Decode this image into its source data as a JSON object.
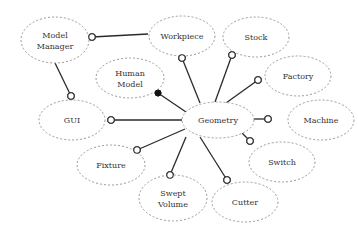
{
  "diagram": {
    "title": "",
    "center_node": "Geometry",
    "nodes": [
      {
        "id": "model_manager",
        "label_lines": [
          "Model",
          "Manager"
        ],
        "cx": 55,
        "cy": 40,
        "rx": 34,
        "ry": 23
      },
      {
        "id": "workpiece",
        "label_lines": [
          "Workpiece"
        ],
        "cx": 182,
        "cy": 36,
        "rx": 33,
        "ry": 20
      },
      {
        "id": "stock",
        "label_lines": [
          "Stock"
        ],
        "cx": 256,
        "cy": 37,
        "rx": 33,
        "ry": 20
      },
      {
        "id": "human_model",
        "label_lines": [
          "Human",
          "Model"
        ],
        "cx": 130,
        "cy": 78,
        "rx": 34,
        "ry": 20
      },
      {
        "id": "factory",
        "label_lines": [
          "Factory"
        ],
        "cx": 298,
        "cy": 76,
        "rx": 33,
        "ry": 20
      },
      {
        "id": "gui",
        "label_lines": [
          "GUI"
        ],
        "cx": 72,
        "cy": 120,
        "rx": 33,
        "ry": 20
      },
      {
        "id": "geometry",
        "label_lines": [
          "Geometry"
        ],
        "cx": 218,
        "cy": 120,
        "rx": 36,
        "ry": 18
      },
      {
        "id": "machine",
        "label_lines": [
          "Machine"
        ],
        "cx": 321,
        "cy": 120,
        "rx": 33,
        "ry": 20
      },
      {
        "id": "fixture",
        "label_lines": [
          "Fixture"
        ],
        "cx": 111,
        "cy": 165,
        "rx": 34,
        "ry": 20
      },
      {
        "id": "switch",
        "label_lines": [
          "Switch"
        ],
        "cx": 282,
        "cy": 162,
        "rx": 33,
        "ry": 20
      },
      {
        "id": "swept_volume",
        "label_lines": [
          "Swept",
          "Volume"
        ],
        "cx": 173,
        "cy": 198,
        "rx": 34,
        "ry": 23
      },
      {
        "id": "cutter",
        "label_lines": [
          "Cutter"
        ],
        "cx": 245,
        "cy": 202,
        "rx": 33,
        "ry": 20
      }
    ],
    "edges": [
      {
        "from": "model_manager",
        "to": "workpiece",
        "x1": 92,
        "y1": 37,
        "x2": 148,
        "y2": 34,
        "end": "open",
        "end_at": "x1"
      },
      {
        "from": "model_manager",
        "to": "gui",
        "x1": 55,
        "y1": 63,
        "x2": 71,
        "y2": 96,
        "end": "open",
        "end_at": "x2"
      },
      {
        "from": "gui",
        "to": "geometry",
        "x1": 111,
        "y1": 120,
        "x2": 182,
        "y2": 120,
        "end": "open",
        "end_at": "x1"
      },
      {
        "from": "geometry",
        "to": "workpiece",
        "x1": 200,
        "y1": 103,
        "x2": 182,
        "y2": 58,
        "end": "open",
        "end_at": "x2"
      },
      {
        "from": "geometry",
        "to": "stock",
        "x1": 215,
        "y1": 102,
        "x2": 232,
        "y2": 55,
        "end": "open",
        "end_at": "x2"
      },
      {
        "from": "geometry",
        "to": "factory",
        "x1": 226,
        "y1": 103,
        "x2": 258,
        "y2": 80,
        "end": "open",
        "end_at": "x2"
      },
      {
        "from": "geometry",
        "to": "machine",
        "x1": 254,
        "y1": 119,
        "x2": 268,
        "y2": 119,
        "end": "open",
        "end_at": "x2"
      },
      {
        "from": "geometry",
        "to": "switch",
        "x1": 242,
        "y1": 133,
        "x2": 250,
        "y2": 141,
        "end": "open",
        "end_at": "x2"
      },
      {
        "from": "geometry",
        "to": "cutter",
        "x1": 200,
        "y1": 137,
        "x2": 227,
        "y2": 180,
        "end": "open",
        "end_at": "x2"
      },
      {
        "from": "geometry",
        "to": "swept_volume",
        "x1": 186,
        "y1": 137,
        "x2": 170,
        "y2": 175,
        "end": "open",
        "end_at": "x2"
      },
      {
        "from": "geometry",
        "to": "fixture",
        "x1": 185,
        "y1": 129,
        "x2": 137,
        "y2": 150,
        "end": "open",
        "end_at": "x2"
      },
      {
        "from": "geometry",
        "to": "human_model",
        "x1": 186,
        "y1": 112,
        "x2": 158,
        "y2": 93,
        "end": "filled",
        "end_at": "x2"
      }
    ]
  }
}
